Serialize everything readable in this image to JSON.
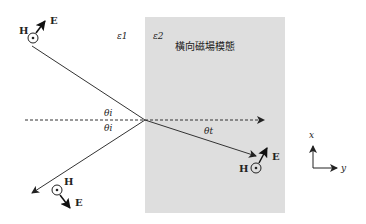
{
  "diagram": {
    "regions": {
      "medium1": {
        "label": "ε1"
      },
      "medium2": {
        "label": "ε2",
        "caption": "橫向磁場模態",
        "fill": "#dedede"
      }
    },
    "angles": {
      "incident": "θi",
      "reflected": "θi",
      "transmitted": "θt"
    },
    "incident_wave": {
      "H": "H",
      "E": "E"
    },
    "reflected_wave": {
      "H": "H",
      "E": "E"
    },
    "transmitted_wave": {
      "H": "H",
      "E": "E"
    },
    "axes": {
      "x": "x",
      "y": "y"
    }
  }
}
